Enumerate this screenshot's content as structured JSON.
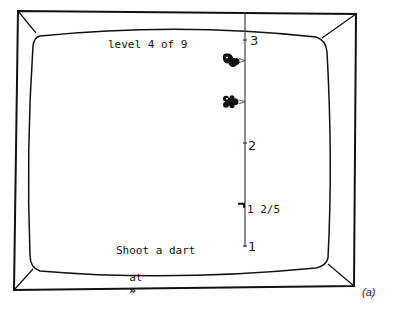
{
  "game": {
    "level_text": "level 4 of 9",
    "level_current": 4,
    "level_total": 9,
    "instruction_line1": "Shoot a dart",
    "instruction_line2_prefix": "at",
    "instruction_target_icon": "double-chevron-right-icon",
    "instruction_target_glyph": "»",
    "caption": "(a)"
  },
  "number_line": {
    "min": 1,
    "max": 3,
    "tick_labels": [
      "3",
      "2",
      "1"
    ],
    "target_label": "1 2/5",
    "target_value": 1.4,
    "creatures": [
      {
        "name": "bird-creature",
        "value": 2.8
      },
      {
        "name": "bug-creature",
        "value": 2.4
      }
    ]
  }
}
